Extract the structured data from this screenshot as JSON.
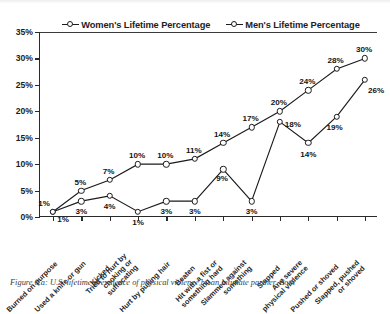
{
  "figure": {
    "caption": "Figure 6.a: U.S. lifetime prevalence of physical violence by an intimate partner. Both"
  },
  "legend": {
    "position": "top-center",
    "items": [
      {
        "label": "Women's Lifetime Percentage",
        "marker": "open-circle-line-marker"
      },
      {
        "label": "Men's Lifetime Percentage",
        "marker": "open-circle-line-marker"
      }
    ]
  },
  "axes": {
    "y_ticks": [
      "35%",
      "30%",
      "25%",
      "20%",
      "15%",
      "10%",
      "5%",
      "0%"
    ],
    "x_ticks_count": 12
  },
  "chart_data": {
    "type": "line",
    "title": "",
    "subtitle": "",
    "xlabel": "",
    "ylabel": "",
    "ylim": [
      0,
      35
    ],
    "ytick_step": 5,
    "ytick_format": "percent",
    "grid": false,
    "legend_position": "top-center",
    "categories": [
      "Burned on purpose",
      "Used a knife or gun",
      "Kicked",
      "Tried to hurt by choking or suffocating",
      "Hurt by pulling hair",
      "Beaten",
      "Hit with a fist or something hard",
      "Slammed against something",
      "Slapped",
      "Any severe physical violence",
      "Pushed or shoved",
      "Slapped, pushed or shoved"
    ],
    "series": [
      {
        "name": "Women's Lifetime Percentage",
        "values": [
          1,
          5,
          7,
          10,
          10,
          11,
          14,
          17,
          20,
          24,
          28,
          30
        ],
        "labels": [
          "1%",
          "5%",
          "7%",
          "10%",
          "10%",
          "11%",
          "14%",
          "17%",
          "20%",
          "24%",
          "28%",
          "30%"
        ]
      },
      {
        "name": "Men's Lifetime Percentage",
        "values": [
          1,
          3,
          4,
          1,
          3,
          3,
          9,
          3,
          18,
          14,
          19,
          26
        ],
        "labels": [
          "1%",
          "3%",
          "4%",
          "1%",
          "3%",
          "3%",
          "9%",
          "3%",
          "18%",
          "14%",
          "19%",
          "26%"
        ]
      }
    ]
  }
}
